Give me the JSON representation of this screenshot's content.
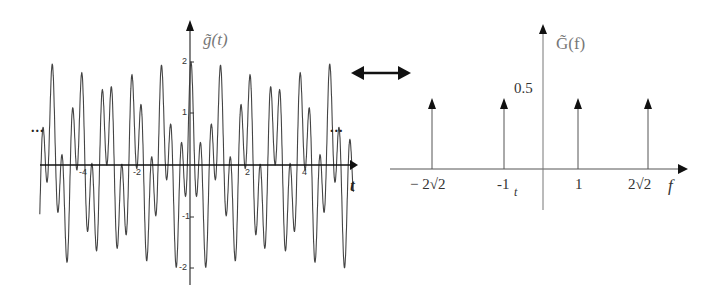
{
  "left_plot": {
    "y_label": "g̃(t)",
    "x_label": "t",
    "x_ticks": [
      "-4",
      "-2",
      "2",
      "4"
    ],
    "y_ticks": [
      "2",
      "1",
      "-1",
      "-2"
    ],
    "ellipsis_left": "...",
    "ellipsis_right": "..."
  },
  "transform_arrow": {
    "icon": "double-headed-arrow-icon"
  },
  "right_plot": {
    "y_label": "G̃(f)",
    "x_label": "f",
    "y_tick": "0.5",
    "x_ticks": [
      "− 2√2",
      "-1",
      "1",
      "2√2"
    ],
    "stray_t": "t"
  },
  "chart_data": [
    {
      "type": "line",
      "title": "g̃(t)",
      "xlabel": "t",
      "ylabel": "g̃(t)",
      "x_ticks": [
        -4,
        -2,
        2,
        4
      ],
      "y_ticks": [
        -2,
        -1,
        1,
        2
      ],
      "xlim": [
        -5.4,
        5.8
      ],
      "ylim": [
        -2.3,
        2.5
      ],
      "function": "cos(2πt) + cos(2π·2√2·t)",
      "periodic_continuation": true,
      "grid": false
    },
    {
      "type": "bar",
      "subtype": "impulse",
      "title": "G̃(f)",
      "xlabel": "f",
      "ylabel": "G̃(f)",
      "categories": [
        "-2√2",
        "-1",
        "1",
        "2√2"
      ],
      "x": [
        -2.828,
        -1,
        1,
        2.828
      ],
      "values": [
        0.5,
        0.5,
        0.5,
        0.5
      ],
      "y_ticks": [
        0.5
      ],
      "grid": false
    }
  ]
}
